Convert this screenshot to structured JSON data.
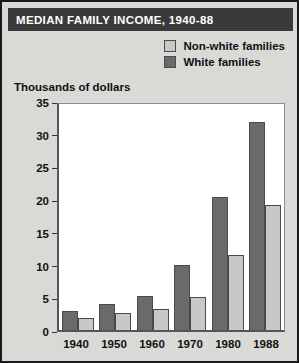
{
  "title": "MEDIAN FAMILY INCOME, 1940-88",
  "axis_title": "Thousands of dollars",
  "colors": {
    "frame_border": "#1a1a1a",
    "panel_background": "#d9d9d6",
    "title_bar": "#3a3a3a",
    "title_text": "#ffffff",
    "plot_background": "#ffffff",
    "non_white_families": "#c8c8c8",
    "white_families": "#6a6a6a",
    "bar_outline": "#4a4a4a",
    "axis": "#555555"
  },
  "legend": {
    "position": "top-right",
    "entries": [
      {
        "label": "Non-white families",
        "color": "#c8c8c8"
      },
      {
        "label": "White families",
        "color": "#6a6a6a"
      }
    ]
  },
  "y_ticks": [
    {
      "label": "35",
      "value": 35
    },
    {
      "label": "30",
      "value": 30
    },
    {
      "label": "25",
      "value": 25
    },
    {
      "label": "20",
      "value": 20
    },
    {
      "label": "15",
      "value": 15
    },
    {
      "label": "10",
      "value": 10
    },
    {
      "label": "5",
      "value": 5
    },
    {
      "label": "0",
      "value": 0
    }
  ],
  "chart_data": {
    "type": "bar",
    "title": "MEDIAN FAMILY INCOME, 1940-88",
    "xlabel": "",
    "ylabel": "Thousands of dollars",
    "ylim": [
      0,
      35
    ],
    "ytick_step": 5,
    "grid": false,
    "legend_position": "top-right",
    "bar_order_in_group": [
      "White families",
      "Non-white families"
    ],
    "categories": [
      "1940",
      "1950",
      "1960",
      "1970",
      "1980",
      "1988"
    ],
    "series": [
      {
        "name": "White families",
        "color": "#6a6a6a",
        "values": [
          3.0,
          4.0,
          5.3,
          10.0,
          20.5,
          32.0
        ]
      },
      {
        "name": "Non-white families",
        "color": "#c8c8c8",
        "values": [
          1.8,
          2.6,
          3.2,
          5.1,
          11.6,
          19.3
        ]
      }
    ]
  }
}
